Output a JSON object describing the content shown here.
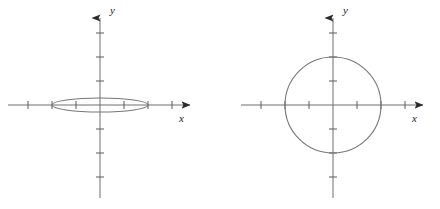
{
  "figure": {
    "title": "",
    "background_color": "#ffffff",
    "width": 440,
    "height": 209,
    "panel_count": 2
  },
  "style": {
    "axis_color": "#6e6e6e",
    "tick_color": "#5a5a5a",
    "curve_color": "#777777",
    "arrow_color": "#2b2b2b",
    "label_color": "#1a1a1a",
    "axis_stroke_width": 1,
    "curve_stroke_width": 1.1,
    "tick_half_length": 4
  },
  "panels": [
    {
      "name": "left-panel",
      "curve_name": "ellipse",
      "x_axis_label": "x",
      "y_axis_label": "y",
      "origin": {
        "x": 100,
        "y": 105
      },
      "tick_spacing": 24,
      "x_axis": {
        "start": 8,
        "end": 196,
        "arrow": "right"
      },
      "y_axis": {
        "start": 198,
        "end": 12,
        "arrow": "up"
      },
      "x_ticks": [
        -3,
        -2,
        -1,
        1,
        2,
        3
      ],
      "y_ticks": [
        -3,
        -2,
        -1,
        1,
        2,
        3
      ],
      "x_label_pos": {
        "x": 179,
        "y": 122
      },
      "y_label_pos": {
        "x": 110,
        "y": 14
      }
    },
    {
      "name": "right-panel",
      "curve_name": "circle",
      "x_axis_label": "x",
      "y_axis_label": "y",
      "origin": {
        "x": 333,
        "y": 105
      },
      "tick_spacing": 24,
      "x_axis": {
        "start": 241,
        "end": 429,
        "arrow": "right"
      },
      "y_axis": {
        "start": 198,
        "end": 12,
        "arrow": "up"
      },
      "x_ticks": [
        -3,
        -2,
        -1,
        1,
        2,
        3
      ],
      "y_ticks": [
        -3,
        -2,
        -1,
        1,
        2,
        3
      ],
      "x_label_pos": {
        "x": 412,
        "y": 122
      },
      "y_label_pos": {
        "x": 343,
        "y": 14
      }
    }
  ],
  "chart_data": {
    "type": "scatter",
    "xlabel": "x",
    "ylabel": "y",
    "grid": false,
    "legend": "none",
    "xlim": [
      -3.8,
      4.0
    ],
    "ylim": [
      -3.8,
      3.9
    ],
    "units_per_tick": 1,
    "pixels_per_unit": 24,
    "series": [
      {
        "name": "ellipse",
        "panel": "left-panel",
        "shape": "ellipse",
        "center": [
          0,
          0
        ],
        "semi_major_axis_x": 2.0,
        "semi_minor_axis_y": 0.29,
        "semi_major_axis_px": 48,
        "semi_minor_axis_px": 7,
        "x_intercepts": [
          -2,
          2
        ],
        "y_intercepts": [
          -0.29,
          0.29
        ],
        "equation": "x^2/4 + y^2/0.0833 = 1"
      },
      {
        "name": "circle",
        "panel": "right-panel",
        "shape": "circle",
        "center": [
          0,
          0
        ],
        "radius": 2.0,
        "radius_px": 48,
        "x_intercepts": [
          -2,
          2
        ],
        "y_intercepts": [
          -2,
          2
        ],
        "equation": "x^2 + y^2 = 4"
      }
    ]
  }
}
